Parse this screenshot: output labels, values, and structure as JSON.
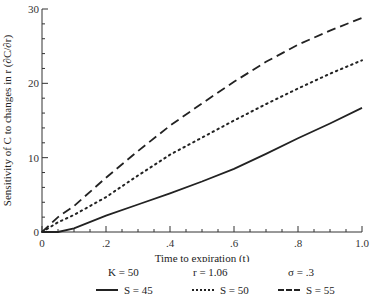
{
  "chart_data": {
    "type": "line",
    "title": "",
    "xlabel": "Time to expiration (t)",
    "ylabel": "Sensitivity of C to changes in r (∂C/∂r)",
    "xlim": [
      0,
      1.0
    ],
    "ylim": [
      0,
      30
    ],
    "x_ticks": [
      "0",
      ".2",
      ".4",
      ".6",
      ".8",
      "1.0"
    ],
    "y_ticks": [
      "0",
      "10",
      "20",
      "30"
    ],
    "grid": false,
    "x": [
      0,
      0.05,
      0.1,
      0.2,
      0.3,
      0.4,
      0.5,
      0.6,
      0.7,
      0.8,
      0.9,
      1.0
    ],
    "series": [
      {
        "name": "S = 45",
        "style": "solid",
        "values": [
          0,
          0.0,
          0.5,
          2.2,
          3.7,
          5.2,
          6.8,
          8.5,
          10.5,
          12.6,
          14.6,
          16.7
        ]
      },
      {
        "name": "S = 50",
        "style": "dotted",
        "values": [
          0,
          1.3,
          2.3,
          4.7,
          7.6,
          10.4,
          12.7,
          15.0,
          17.2,
          19.3,
          21.3,
          23.1
        ]
      },
      {
        "name": "S = 55",
        "style": "dashed",
        "values": [
          0,
          2.0,
          3.5,
          7.3,
          10.9,
          14.3,
          17.3,
          20.2,
          22.9,
          25.2,
          27.1,
          28.8
        ]
      }
    ],
    "annotations": [
      "K = 50",
      "r = 1.06",
      "σ = .3"
    ],
    "legend_position": "bottom"
  },
  "axes": {
    "xlabel": "Time to expiration (t)",
    "ylabel": "Sensitivity of C to changes in r (∂C/∂r)"
  },
  "params": {
    "k": "K = 50",
    "r": "r = 1.06",
    "sigma": "σ = .3"
  },
  "legend": [
    {
      "label": "S = 45",
      "style": "solid"
    },
    {
      "label": "S = 50",
      "style": "dotted"
    },
    {
      "label": "S = 55",
      "style": "dashed"
    }
  ]
}
